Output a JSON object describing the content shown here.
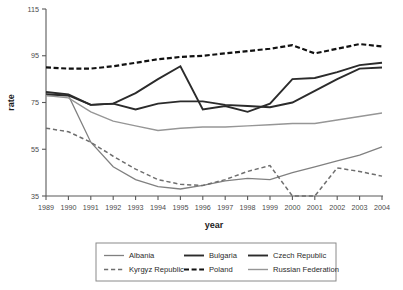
{
  "chart_data": {
    "type": "line",
    "title": "",
    "xlabel": "year",
    "ylabel": "rate",
    "x": [
      1989,
      1990,
      1991,
      1992,
      1993,
      1994,
      1995,
      1996,
      1997,
      1998,
      1999,
      2000,
      2001,
      2002,
      2003,
      2004
    ],
    "xtick_labels": [
      "1989",
      "1990",
      "1991",
      "1992",
      "1993",
      "1994",
      "1995",
      "1996",
      "1997",
      "1998",
      "1999",
      "2000",
      "2001",
      "2002",
      "2003",
      "2004"
    ],
    "ytick_labels": [
      "35",
      "55",
      "75",
      "95",
      "115"
    ],
    "yticks": [
      35,
      55,
      75,
      95,
      115
    ],
    "ylim": [
      35,
      115
    ],
    "xlim": [
      1989,
      2004
    ],
    "grid": false,
    "legend_position": "bottom",
    "series": [
      {
        "name": "Albania",
        "color": "#808080",
        "style": "solid",
        "width": 1.3,
        "values": [
          78.0,
          78.0,
          58.0,
          47.5,
          42.0,
          39.0,
          38.0,
          39.5,
          41.5,
          42.5,
          42.0,
          45.0,
          47.5,
          50.0,
          52.5,
          56.0
        ]
      },
      {
        "name": "Bulgaria",
        "color": "#2b2b2b",
        "style": "solid",
        "width": 1.9,
        "values": [
          78.5,
          78.0,
          74.0,
          74.5,
          72.0,
          74.5,
          75.5,
          75.5,
          74.0,
          73.5,
          73.0,
          75.0,
          80.0,
          85.0,
          89.5,
          90.0
        ]
      },
      {
        "name": "Czech Republic",
        "color": "#2b2b2b",
        "style": "solid",
        "width": 1.9,
        "values": [
          79.5,
          78.5,
          74.0,
          74.5,
          79.0,
          85.0,
          90.5,
          72.0,
          73.5,
          71.0,
          74.5,
          85.0,
          85.5,
          88.0,
          91.0,
          92.0
        ]
      },
      {
        "name": "Kyrgyz Republic",
        "color": "#6e6e6e",
        "style": "dashed",
        "width": 1.5,
        "values": [
          64.0,
          62.5,
          58.0,
          52.0,
          46.5,
          42.0,
          40.0,
          39.5,
          42.0,
          45.5,
          48.0,
          35.0,
          35.0,
          47.0,
          45.5,
          43.5
        ]
      },
      {
        "name": "Poland",
        "color": "#111111",
        "style": "dashed",
        "width": 2.2,
        "values": [
          90.0,
          89.5,
          89.5,
          90.5,
          92.0,
          93.5,
          94.5,
          95.0,
          96.0,
          97.0,
          98.0,
          99.5,
          96.0,
          98.0,
          100.0,
          99.0
        ]
      },
      {
        "name": "Russian Federation",
        "color": "#969696",
        "style": "solid",
        "width": 1.4,
        "values": [
          78.0,
          77.0,
          71.0,
          67.0,
          65.0,
          63.0,
          64.0,
          64.5,
          64.5,
          65.0,
          65.5,
          66.0,
          66.0,
          67.5,
          69.0,
          70.5
        ]
      }
    ]
  },
  "legend": {
    "entries": [
      {
        "label": "Albania"
      },
      {
        "label": "Bulgaria"
      },
      {
        "label": "Czech Republic"
      },
      {
        "label": "Kyrgyz Republic"
      },
      {
        "label": "Poland"
      },
      {
        "label": "Russian Federation"
      }
    ]
  }
}
